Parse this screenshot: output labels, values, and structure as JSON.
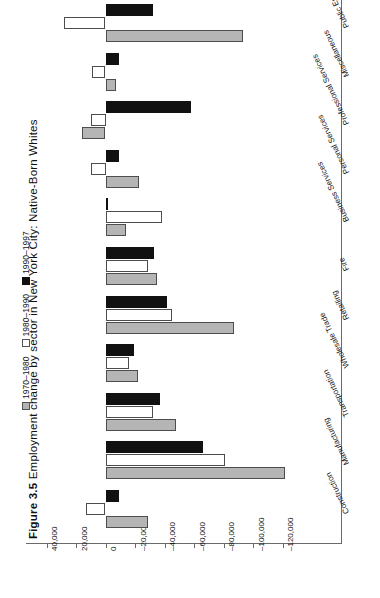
{
  "title": {
    "number": "Figure 3.5",
    "text": "Employment change by sector in New York City: Native-Born Whites"
  },
  "legend": [
    {
      "label": "1970–1980",
      "swatch": "gray",
      "color": "#b5b5b5"
    },
    {
      "label": "1980–1990",
      "swatch": "white",
      "color": "#ffffff"
    },
    {
      "label": "1990–1997",
      "swatch": "black",
      "color": "#111111"
    }
  ],
  "axis": {
    "ticks": [
      "40,000",
      "20,000",
      "0",
      "–20,000",
      "–40,000",
      "–60,000",
      "–80,000",
      "–100,000",
      "–120,000"
    ]
  },
  "categories": [
    "Public Employment",
    "Miscellaneous",
    "Professional Services",
    "Personal Services",
    "Business Services",
    "Fire",
    "Retailing",
    "Wholesale Trade",
    "Transportation",
    "Manufacturing",
    "Construction"
  ],
  "chart_data": {
    "type": "bar",
    "orientation": "horizontal",
    "title": "Figure 3.5  Employment change by sector in New York City: Native-Born Whites",
    "xlabel": "",
    "ylabel": "",
    "xlim": [
      40000,
      -126000
    ],
    "grid": false,
    "legend_position": "top-left",
    "categories": [
      "Public Employment",
      "Miscellaneous",
      "Professional Services",
      "Personal Services",
      "Business Services",
      "Fire",
      "Retailing",
      "Wholesale Trade",
      "Transportation",
      "Manufacturing",
      "Construction"
    ],
    "series": [
      {
        "name": "1970–1980",
        "color": "#b5b5b5",
        "values": [
          -93000,
          -7000,
          16000,
          -23000,
          -14000,
          -35000,
          -87000,
          -22000,
          -48000,
          -122000,
          -29000
        ]
      },
      {
        "name": "1980–1990",
        "color": "#ffffff",
        "values": [
          28000,
          9000,
          10000,
          10000,
          -38000,
          -29000,
          -45000,
          -16000,
          -32000,
          -81000,
          13000
        ]
      },
      {
        "name": "1990–1997",
        "color": "#111111",
        "values": [
          -32000,
          -9000,
          -58000,
          -9000,
          -1000,
          -33000,
          -42000,
          -19000,
          -37000,
          -66000,
          -9000
        ]
      }
    ]
  }
}
